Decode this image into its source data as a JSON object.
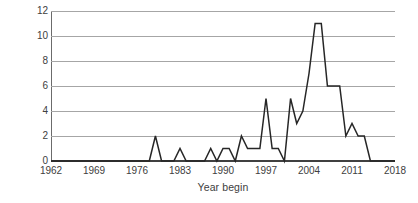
{
  "chart_data": {
    "type": "line",
    "title": "",
    "subtitle": "",
    "xlabel": "Year begin",
    "ylabel": "Mortgage",
    "xlim": [
      1962,
      2018
    ],
    "ylim": [
      0,
      12
    ],
    "grid": "horizontal",
    "legend": "none",
    "line_color": "#262626",
    "gridline_color": "#a6a6a6",
    "axis_color": "#404040",
    "background_color": "#ffffff",
    "x_ticks": [
      1962,
      1969,
      1976,
      1983,
      1990,
      1997,
      2004,
      2011,
      2018
    ],
    "y_ticks": [
      0,
      2,
      4,
      6,
      8,
      10,
      12
    ],
    "x": [
      1962,
      1963,
      1964,
      1965,
      1966,
      1967,
      1968,
      1969,
      1970,
      1971,
      1972,
      1973,
      1974,
      1975,
      1976,
      1977,
      1978,
      1979,
      1980,
      1981,
      1982,
      1983,
      1984,
      1985,
      1986,
      1987,
      1988,
      1989,
      1990,
      1991,
      1992,
      1993,
      1994,
      1995,
      1996,
      1997,
      1998,
      1999,
      2000,
      2001,
      2002,
      2003,
      2004,
      2005,
      2006,
      2007,
      2008,
      2009,
      2010,
      2011,
      2012,
      2013,
      2014,
      2015,
      2016,
      2017,
      2018
    ],
    "values": [
      0,
      0,
      0,
      0,
      0,
      0,
      0,
      0,
      0,
      0,
      0,
      0,
      0,
      0,
      0,
      0,
      0,
      2,
      0,
      0,
      0,
      1,
      0,
      0,
      0,
      0,
      1,
      0,
      1,
      1,
      0,
      2,
      1,
      1,
      1,
      5,
      1,
      1,
      0,
      5,
      3,
      4,
      7,
      11,
      11,
      6,
      6,
      6,
      2,
      3,
      2,
      2,
      0,
      0,
      0,
      0,
      0
    ],
    "series_name": "Mortgage",
    "annotations": []
  },
  "axis": {
    "y_title": "Mortgage",
    "x_title": "Year begin"
  }
}
